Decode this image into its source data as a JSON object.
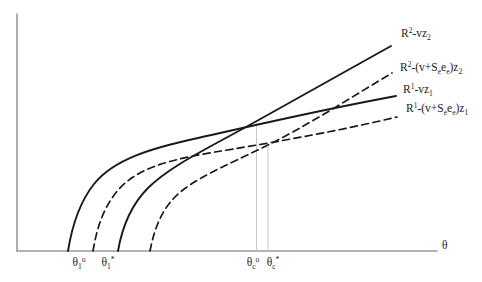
{
  "figure": {
    "width": 482,
    "height": 282,
    "colors": {
      "background": "#ffffff",
      "axis": "#9a9a9a",
      "curve": "#191919",
      "guide": "#c6c6c6",
      "text": "#1b1b1b"
    },
    "axes": {
      "y_axis": {
        "x": 17,
        "y_top": 14,
        "y_bottom": 251
      },
      "x_axis": {
        "y": 251,
        "x_left": 17,
        "x_right": 437
      }
    },
    "guides": [
      {
        "name": "guide-theta-c-o",
        "x": 256.5,
        "y_top": 123,
        "y_bottom": 251
      },
      {
        "name": "guide-theta-c-star",
        "x": 268,
        "y_top": 147,
        "y_bottom": 251
      }
    ],
    "curves": [
      {
        "name": "curve-r1-vz1",
        "style": "solid",
        "label_text": "R1-vz1",
        "path": "M 68,251 C 72,226 79,203 94,184 C 114,159 152,148 198,138 C 252,126 310,112 396,96"
      },
      {
        "name": "curve-r1-subsidy",
        "style": "dashed",
        "label_text": "R1-(v+Se ee)z1",
        "path": "M 93,251 C 97,227 104,206 119,189 C 140,166 175,159 215,152 C 258,145 330,133 397,117"
      },
      {
        "name": "curve-r2-vz2",
        "style": "solid",
        "label_text": "R2-vz2",
        "path": "M 118,251 C 122,228 131,205 148,188 C 170,166 205,150 255,122 C 300,97 345,72 391,46"
      },
      {
        "name": "curve-r2-subsidy",
        "style": "dashed",
        "label_text": "R2-(v+Se ee)z2",
        "path": "M 150,251 C 154,230 161,211 175,197 C 193,179 225,166 264,147 C 307,126 350,98 392,73"
      }
    ],
    "curve_labels": [
      {
        "name": "label-r2-vz2",
        "x": 401,
        "y": 27,
        "anchor": "left",
        "segments": [
          [
            "R",
            ""
          ],
          [
            "2",
            "sup"
          ],
          [
            "-vz",
            ""
          ],
          [
            "2",
            "sub"
          ]
        ]
      },
      {
        "name": "label-r2-subsidy",
        "x": 400,
        "y": 61,
        "anchor": "left",
        "segments": [
          [
            "R",
            ""
          ],
          [
            "2",
            "sup"
          ],
          [
            "-(v+S",
            ""
          ],
          [
            "e",
            "sub"
          ],
          [
            "e",
            ""
          ],
          [
            "e",
            "sub"
          ],
          [
            ")z",
            ""
          ],
          [
            "2",
            "sub"
          ]
        ]
      },
      {
        "name": "label-r1-vz1",
        "x": 403,
        "y": 83,
        "anchor": "left",
        "segments": [
          [
            "R",
            ""
          ],
          [
            "1",
            "sup"
          ],
          [
            "-vz",
            ""
          ],
          [
            "1",
            "sub"
          ]
        ]
      },
      {
        "name": "label-r1-subsidy",
        "x": 406,
        "y": 102,
        "anchor": "left",
        "segments": [
          [
            "R",
            ""
          ],
          [
            "1",
            "sup"
          ],
          [
            "-(v+S",
            ""
          ],
          [
            "e",
            "sub"
          ],
          [
            "e",
            ""
          ],
          [
            "e",
            "sub"
          ],
          [
            ")z",
            ""
          ],
          [
            "1",
            "sub"
          ]
        ]
      }
    ],
    "axis_labels": [
      {
        "name": "label-theta-1-o",
        "x": 79,
        "y": 256,
        "anchor": "center",
        "segments": [
          [
            "θ",
            ""
          ],
          [
            "1",
            "sub"
          ],
          [
            "o",
            "sup"
          ]
        ]
      },
      {
        "name": "label-theta-1-star",
        "x": 108,
        "y": 256,
        "anchor": "center",
        "segments": [
          [
            "θ",
            ""
          ],
          [
            "1",
            "sub"
          ],
          [
            "*",
            "sup"
          ]
        ]
      },
      {
        "name": "label-theta-c-o",
        "x": 253,
        "y": 256,
        "anchor": "center",
        "segments": [
          [
            "θ",
            ""
          ],
          [
            "c",
            "sub"
          ],
          [
            "o",
            "sup"
          ]
        ]
      },
      {
        "name": "label-theta-c-star",
        "x": 273,
        "y": 256,
        "anchor": "center",
        "segments": [
          [
            "θ",
            ""
          ],
          [
            "c",
            "sub"
          ],
          [
            "*",
            "sup"
          ]
        ]
      },
      {
        "name": "label-theta-axis",
        "x": 442,
        "y": 239,
        "anchor": "left",
        "segments": [
          [
            "θ",
            ""
          ]
        ]
      }
    ]
  }
}
